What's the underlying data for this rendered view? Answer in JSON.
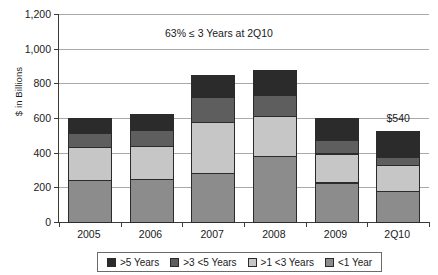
{
  "chart_data": {
    "type": "bar",
    "subtype": "stacked-bar",
    "title": "",
    "xlabel": "",
    "ylabel": "$ in Billions",
    "ylim": [
      0,
      1200
    ],
    "ytick_values": [
      0,
      200,
      400,
      600,
      800,
      1000,
      1200
    ],
    "ytick_labels": [
      "0",
      "200",
      "400",
      "600",
      "800",
      "1,000",
      "1,200"
    ],
    "grid": true,
    "legend_position": "bottom",
    "categories": [
      "2005",
      "2006",
      "2007",
      "2008",
      "2009",
      "2Q10"
    ],
    "series": [
      {
        "name": "<1 Year",
        "color": "#8c8c8c",
        "values": [
          245,
          253,
          290,
          385,
          233,
          183
        ]
      },
      {
        "name": ">1 <3 Years",
        "color": "#c6c6c6",
        "values": [
          200,
          195,
          298,
          237,
          172,
          157
        ]
      },
      {
        "name": ">3 <5 Years",
        "color": "#5e5e5e",
        "values": [
          85,
          100,
          150,
          127,
          83,
          52
        ]
      },
      {
        "name": ">5 Years",
        "color": "#2b2b2b",
        "values": [
          85,
          88,
          125,
          145,
          127,
          148
        ]
      }
    ],
    "totals": [
      615,
      636,
      863,
      894,
      615,
      540
    ],
    "stack_order_bottom_to_top": [
      "<1 Year",
      ">1 <3 Years",
      ">3 <5 Years",
      ">5 Years"
    ],
    "data_labels": [
      {
        "category": "2Q10",
        "text": "$540",
        "value": 540
      }
    ],
    "annotations": [
      {
        "text": "63% ≤ 3 Years at 2Q10"
      }
    ],
    "legend_entries": [
      {
        "label": ">5 Years",
        "color": "#2b2b2b"
      },
      {
        "label": ">3 <5 Years",
        "color": "#5e5e5e"
      },
      {
        "label": ">1 <3 Years",
        "color": "#c6c6c6"
      },
      {
        "label": "<1 Year",
        "color": "#8c8c8c"
      }
    ]
  },
  "colors": {
    "axis": "#3a3a3a",
    "grid": "#a9a9a9",
    "text": "#1a1a1a",
    "background": "#ffffff",
    "legend_border": "#6b6b6b",
    "bar_outline": "#2b2b2b"
  }
}
